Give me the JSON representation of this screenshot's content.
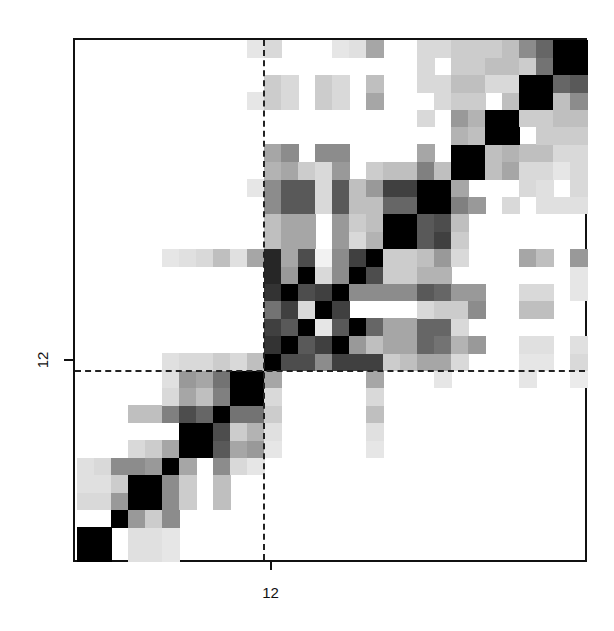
{
  "chart_data": {
    "type": "heatmap",
    "title": "",
    "xlabel": "",
    "ylabel": "",
    "n": 30,
    "row_order": "bottom-to-top",
    "colormap": "grayscale (0 = white, 1 = black)",
    "x_ticks": [
      {
        "position": 12,
        "label": "12"
      }
    ],
    "y_ticks": [
      {
        "position": 12,
        "label": "12"
      }
    ],
    "divider_lines": {
      "vertical_after_index": 11,
      "horizontal_after_index": 11,
      "style": "dashed"
    },
    "grid": false,
    "legend": null,
    "matrix": [
      [
        1,
        1,
        0,
        0.12,
        0.12,
        0.1,
        0,
        0,
        0,
        0,
        0,
        0,
        0,
        0,
        0,
        0,
        0,
        0,
        0,
        0,
        0,
        0,
        0,
        0,
        0,
        0,
        0,
        0,
        0,
        0
      ],
      [
        1,
        1,
        0,
        0.12,
        0.12,
        0.1,
        0,
        0,
        0,
        0,
        0,
        0,
        0,
        0,
        0,
        0,
        0,
        0,
        0,
        0,
        0,
        0,
        0,
        0,
        0,
        0,
        0,
        0,
        0,
        0
      ],
      [
        0,
        0,
        1,
        0.4,
        0.2,
        0.45,
        0,
        0,
        0,
        0,
        0,
        0,
        0,
        0,
        0,
        0,
        0,
        0,
        0,
        0,
        0,
        0,
        0,
        0,
        0,
        0,
        0,
        0,
        0,
        0
      ],
      [
        0.15,
        0.15,
        0.4,
        1,
        1,
        0.45,
        0.2,
        0,
        0.25,
        0,
        0,
        0,
        0,
        0,
        0,
        0,
        0,
        0,
        0,
        0,
        0,
        0,
        0,
        0,
        0,
        0,
        0,
        0,
        0,
        0
      ],
      [
        0.12,
        0.12,
        0.2,
        1,
        1,
        0.45,
        0.2,
        0,
        0.25,
        0,
        0,
        0,
        0,
        0,
        0,
        0,
        0,
        0,
        0,
        0,
        0,
        0,
        0,
        0,
        0,
        0,
        0,
        0,
        0,
        0
      ],
      [
        0.12,
        0.15,
        0.45,
        0.45,
        0.4,
        1,
        0.35,
        0,
        0.45,
        0.15,
        0.1,
        0,
        0,
        0,
        0,
        0,
        0,
        0,
        0,
        0,
        0,
        0,
        0,
        0,
        0,
        0,
        0,
        0,
        0,
        0
      ],
      [
        0,
        0,
        0,
        0.15,
        0.2,
        0.35,
        1,
        1,
        0.65,
        0.35,
        0.4,
        0.1,
        0,
        0,
        0,
        0,
        0,
        0.1,
        0,
        0,
        0,
        0,
        0,
        0,
        0,
        0,
        0,
        0,
        0,
        0
      ],
      [
        0,
        0,
        0,
        0,
        0,
        0,
        1,
        1,
        0.7,
        0.2,
        0.3,
        0.12,
        0,
        0,
        0,
        0,
        0,
        0.12,
        0,
        0,
        0,
        0,
        0,
        0,
        0,
        0,
        0,
        0,
        0,
        0
      ],
      [
        0,
        0,
        0,
        0.25,
        0.25,
        0.5,
        0.7,
        0.6,
        1,
        0.55,
        0.55,
        0.2,
        0,
        0,
        0,
        0,
        0,
        0.25,
        0,
        0,
        0,
        0,
        0,
        0,
        0,
        0,
        0,
        0,
        0,
        0
      ],
      [
        0,
        0,
        0,
        0,
        0,
        0.15,
        0.35,
        0.25,
        0.5,
        1,
        1,
        0.15,
        0,
        0,
        0,
        0,
        0,
        0.15,
        0,
        0,
        0,
        0,
        0,
        0,
        0,
        0,
        0,
        0,
        0,
        0
      ],
      [
        0,
        0,
        0,
        0,
        0,
        0.12,
        0.4,
        0.35,
        0.55,
        1,
        1,
        0.35,
        0,
        0,
        0,
        0,
        0,
        0.35,
        0,
        0,
        0,
        0.1,
        0,
        0,
        0,
        0,
        0.1,
        0,
        0,
        0.08
      ],
      [
        0,
        0,
        0,
        0,
        0,
        0.12,
        0.15,
        0.15,
        0.2,
        0.15,
        0.25,
        1,
        0.7,
        0.7,
        0.45,
        0.75,
        0.75,
        0.75,
        0.2,
        0.25,
        0.35,
        0.35,
        0.15,
        0,
        0,
        0,
        0.1,
        0.1,
        0,
        0.15
      ],
      [
        0,
        0,
        0,
        0,
        0,
        0,
        0,
        0,
        0,
        0,
        0,
        0.8,
        1,
        0.65,
        0.75,
        1,
        0.4,
        0.25,
        0.35,
        0.35,
        0.6,
        0.55,
        0.3,
        0.4,
        0,
        0,
        0.12,
        0.12,
        0,
        0.12
      ],
      [
        0,
        0,
        0,
        0,
        0,
        0,
        0,
        0,
        0,
        0,
        0,
        0.75,
        0.65,
        1,
        0.1,
        0.65,
        1,
        0.6,
        0.35,
        0.35,
        0.6,
        0.6,
        0.15,
        0,
        0,
        0,
        0,
        0,
        0,
        0
      ],
      [
        0,
        0,
        0,
        0,
        0,
        0,
        0,
        0,
        0,
        0,
        0,
        0.55,
        0.75,
        0.15,
        1,
        0.75,
        0,
        0,
        0,
        0,
        0.15,
        0.2,
        0.2,
        0.45,
        0,
        0,
        0.25,
        0.25,
        0,
        0
      ],
      [
        0,
        0,
        0,
        0,
        0,
        0,
        0,
        0,
        0,
        0,
        0,
        0.8,
        1,
        0.7,
        0.75,
        1,
        0.45,
        0.45,
        0.45,
        0.45,
        0.65,
        0.6,
        0.4,
        0.4,
        0,
        0,
        0.15,
        0.15,
        0,
        0.1
      ],
      [
        0,
        0,
        0,
        0,
        0,
        0,
        0,
        0,
        0,
        0,
        0,
        0.85,
        0.4,
        1,
        0.15,
        0.45,
        1,
        0.7,
        0.2,
        0.2,
        0.3,
        0.3,
        0,
        0,
        0,
        0,
        0,
        0,
        0,
        0.1
      ],
      [
        0,
        0,
        0,
        0,
        0,
        0.1,
        0.12,
        0.15,
        0.25,
        0.12,
        0.35,
        0.85,
        0.35,
        0.7,
        0.05,
        0.45,
        0.75,
        1,
        0.2,
        0.2,
        0.25,
        0.4,
        0.15,
        0,
        0,
        0,
        0.35,
        0.25,
        0,
        0.4
      ],
      [
        0,
        0,
        0,
        0,
        0,
        0,
        0,
        0,
        0,
        0,
        0,
        0.25,
        0.35,
        0.35,
        0,
        0.4,
        0.15,
        0.3,
        1,
        1,
        0.65,
        0.75,
        0.2,
        0,
        0,
        0,
        0,
        0,
        0,
        0
      ],
      [
        0,
        0,
        0,
        0,
        0,
        0,
        0,
        0,
        0,
        0,
        0,
        0.25,
        0.35,
        0.35,
        0,
        0.4,
        0.2,
        0.25,
        1,
        1,
        0.65,
        0.7,
        0.25,
        0,
        0,
        0,
        0,
        0,
        0,
        0
      ],
      [
        0,
        0,
        0,
        0,
        0,
        0,
        0,
        0,
        0,
        0,
        0,
        0.45,
        0.65,
        0.65,
        0.15,
        0.65,
        0.25,
        0.25,
        0.6,
        0.6,
        1,
        1,
        0.5,
        0.4,
        0,
        0.15,
        0,
        0.12,
        0.12,
        0.12
      ],
      [
        0,
        0,
        0,
        0,
        0,
        0,
        0,
        0,
        0,
        0,
        0.1,
        0.45,
        0.65,
        0.65,
        0.15,
        0.65,
        0.25,
        0.4,
        0.75,
        0.75,
        1,
        1,
        0.35,
        0,
        0,
        0,
        0.15,
        0.12,
        0,
        0.15
      ],
      [
        0,
        0,
        0,
        0,
        0,
        0,
        0,
        0,
        0,
        0,
        0,
        0.3,
        0.35,
        0.2,
        0.15,
        0.4,
        0,
        0.2,
        0.25,
        0.25,
        0.5,
        0.25,
        1,
        1,
        0.25,
        0.35,
        0.15,
        0.15,
        0.1,
        0.15
      ],
      [
        0,
        0,
        0,
        0,
        0,
        0,
        0,
        0,
        0,
        0,
        0,
        0.35,
        0.45,
        0,
        0.45,
        0.45,
        0,
        0,
        0,
        0,
        0.35,
        0,
        1,
        1,
        0.25,
        0.3,
        0.25,
        0.25,
        0.15,
        0.15
      ],
      [
        0,
        0,
        0,
        0,
        0,
        0,
        0,
        0,
        0,
        0,
        0,
        0,
        0,
        0,
        0,
        0,
        0,
        0,
        0,
        0,
        0,
        0,
        0.3,
        0.25,
        1,
        1,
        0,
        0.2,
        0.2,
        0.2
      ],
      [
        0,
        0,
        0,
        0,
        0,
        0,
        0,
        0,
        0,
        0,
        0,
        0,
        0,
        0,
        0,
        0,
        0,
        0,
        0,
        0,
        0.15,
        0,
        0.4,
        0.3,
        1,
        1,
        0.2,
        0.2,
        0.25,
        0.25
      ],
      [
        0,
        0,
        0,
        0,
        0,
        0,
        0,
        0,
        0,
        0,
        0.1,
        0.2,
        0.15,
        0,
        0.2,
        0.15,
        0,
        0.35,
        0,
        0,
        0,
        0.15,
        0.2,
        0.2,
        0,
        0.25,
        1,
        1,
        0.25,
        0.45
      ],
      [
        0,
        0,
        0,
        0,
        0,
        0,
        0,
        0,
        0,
        0,
        0,
        0.2,
        0.15,
        0,
        0.2,
        0.15,
        0,
        0.25,
        0,
        0,
        0.15,
        0.15,
        0.25,
        0.25,
        0.15,
        0.15,
        1,
        1,
        0.6,
        0.65
      ],
      [
        0,
        0,
        0,
        0,
        0,
        0,
        0,
        0,
        0,
        0,
        0,
        0,
        0,
        0,
        0,
        0,
        0,
        0,
        0,
        0,
        0.15,
        0,
        0.2,
        0.2,
        0.25,
        0.25,
        0.2,
        0.55,
        1,
        1
      ],
      [
        0,
        0,
        0,
        0,
        0,
        0,
        0,
        0,
        0,
        0,
        0.1,
        0.15,
        0,
        0,
        0,
        0.1,
        0.12,
        0.35,
        0,
        0,
        0.15,
        0.15,
        0.2,
        0.2,
        0.2,
        0.25,
        0.45,
        0.6,
        1,
        1
      ]
    ]
  },
  "axes": {
    "x_tick_label": "12",
    "y_tick_label": "12"
  }
}
